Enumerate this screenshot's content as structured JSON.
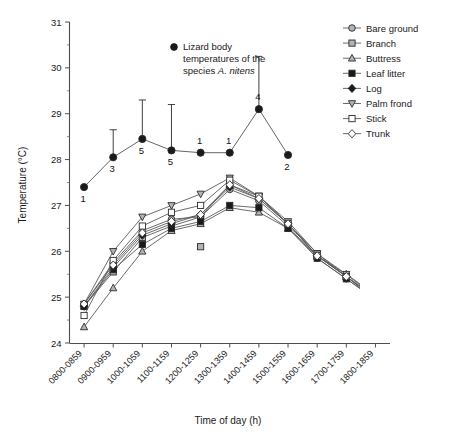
{
  "chart_data": {
    "type": "line",
    "title": "",
    "xlabel": "Time of day (h)",
    "ylabel": "Temperature (°C)",
    "ylim": [
      24,
      31
    ],
    "ytick_labels": [
      "24",
      "25",
      "26",
      "27",
      "28",
      "29",
      "30",
      "31"
    ],
    "ytick_values": [
      24,
      25,
      26,
      27,
      28,
      29,
      30,
      31
    ],
    "yminor_step": 0.5,
    "grid": false,
    "legend_position": "top-right",
    "categories": [
      "0800-0859",
      "0900-0959",
      "1000-1059",
      "1100-1159",
      "1200-1259",
      "1300-1359",
      "1400-1459",
      "1500-1559",
      "1600-1659",
      "1700-1759",
      "1800-1859"
    ],
    "series": [
      {
        "name": "Bare ground",
        "marker": "circle-grey",
        "values": [
          24.85,
          25.75,
          26.45,
          26.7,
          26.75,
          27.35,
          27.1,
          26.55,
          25.85,
          25.4,
          24.95
        ]
      },
      {
        "name": "Branch",
        "marker": "square-grey",
        "values": [
          24.8,
          25.55,
          26.3,
          26.55,
          26.75,
          27.45,
          27.2,
          26.6,
          25.95,
          25.45,
          25.0
        ]
      },
      {
        "name": "Buttress",
        "marker": "triangle-up-grey",
        "values": [
          24.35,
          25.2,
          26.0,
          26.45,
          26.6,
          26.95,
          26.85,
          26.5,
          25.9,
          25.5,
          25.05
        ]
      },
      {
        "name": "Leaf litter",
        "marker": "square-filled",
        "values": [
          24.8,
          25.6,
          26.15,
          26.5,
          26.65,
          27.0,
          26.95,
          26.5,
          25.85,
          25.4,
          24.95
        ]
      },
      {
        "name": "Log",
        "marker": "diamond-filled",
        "values": [
          24.8,
          25.65,
          26.35,
          26.6,
          26.8,
          27.4,
          27.15,
          26.6,
          25.9,
          25.45,
          24.95
        ]
      },
      {
        "name": "Palm frond",
        "marker": "triangle-down-grey",
        "values": [
          24.85,
          26.0,
          26.75,
          27.0,
          27.25,
          27.6,
          27.2,
          26.65,
          25.95,
          25.5,
          25.0
        ]
      },
      {
        "name": "Stick",
        "marker": "square-open",
        "values": [
          24.6,
          25.8,
          26.55,
          26.85,
          27.0,
          27.55,
          27.2,
          26.6,
          25.9,
          25.45,
          24.95
        ]
      },
      {
        "name": "Trunk",
        "marker": "diamond-open",
        "values": [
          24.85,
          25.7,
          26.4,
          26.65,
          26.8,
          27.45,
          27.15,
          26.6,
          25.9,
          25.45,
          25.0
        ]
      }
    ],
    "outlier_points": [
      {
        "series": "Branch",
        "category": "1200-1259",
        "value": 26.1
      }
    ],
    "lizard_series": {
      "name": "Lizard body temperatures of the species A. nitens",
      "marker": "circle-filled-black",
      "categories": [
        "0800-0859",
        "0900-0959",
        "1000-1059",
        "1100-1159",
        "1200-1259",
        "1300-1359",
        "1400-1459",
        "1500-1559"
      ],
      "values": [
        27.4,
        28.05,
        28.45,
        28.2,
        28.15,
        28.15,
        29.1,
        28.1
      ],
      "error_upper": [
        0.0,
        0.6,
        0.85,
        1.0,
        0.0,
        0.0,
        1.15,
        0.0
      ],
      "sample_sizes": [
        "1",
        "3",
        "5",
        "5",
        "1",
        "1",
        "4",
        "2"
      ],
      "error_note": "upper standard error bars"
    },
    "annotation": {
      "line1": "Lizard body",
      "line2": "temperatures of the",
      "line3_prefix": "species ",
      "line3_italic": "A. nitens"
    }
  },
  "legend": {
    "items": [
      {
        "label": "Bare ground"
      },
      {
        "label": "Branch"
      },
      {
        "label": "Buttress"
      },
      {
        "label": "Leaf litter"
      },
      {
        "label": "Log"
      },
      {
        "label": "Palm frond"
      },
      {
        "label": "Stick"
      },
      {
        "label": "Trunk"
      }
    ]
  },
  "colors": {
    "axis": "#4d4d4d",
    "line": "#5a5a5a",
    "marker_fill_grey": "#b3b3b3",
    "marker_fill_black": "#1a1a1a",
    "marker_fill_white": "#ffffff",
    "text": "#1a1a1a",
    "background": "#ffffff"
  }
}
